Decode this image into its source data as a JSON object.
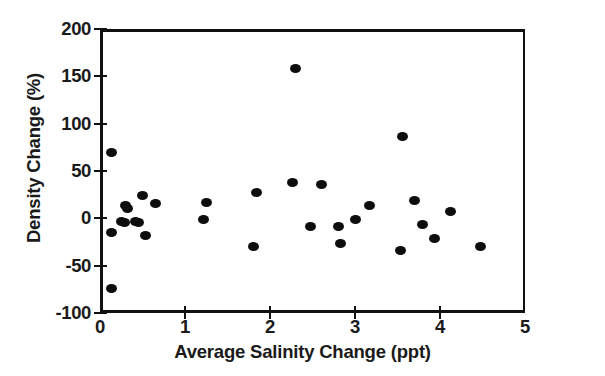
{
  "chart_data": {
    "type": "scatter",
    "title": "",
    "xlabel": "Average Salinity Change (ppt)",
    "ylabel": "Density Change (%)",
    "xlim": [
      0,
      5
    ],
    "ylim": [
      -100,
      200
    ],
    "xticks": [
      0,
      1,
      2,
      3,
      4,
      5
    ],
    "xtick_labels": [
      "0",
      "1",
      "2",
      "3",
      "4",
      "5"
    ],
    "yticks": [
      -100,
      -50,
      0,
      50,
      100,
      150,
      200
    ],
    "ytick_labels": [
      "-100",
      "-50",
      "0",
      "50",
      "100",
      "150",
      "200"
    ],
    "grid": false,
    "legend": null,
    "marker": "filled-circle",
    "marker_color": "#0d0d0d",
    "frame_color": "#111111",
    "points": [
      {
        "x": 0.13,
        "y": 70
      },
      {
        "x": 0.13,
        "y": -15
      },
      {
        "x": 0.14,
        "y": -74
      },
      {
        "x": 0.25,
        "y": -3
      },
      {
        "x": 0.29,
        "y": -4
      },
      {
        "x": 0.3,
        "y": 14
      },
      {
        "x": 0.32,
        "y": 10
      },
      {
        "x": 0.42,
        "y": -3
      },
      {
        "x": 0.45,
        "y": -4
      },
      {
        "x": 0.5,
        "y": 24
      },
      {
        "x": 0.53,
        "y": -18
      },
      {
        "x": 0.65,
        "y": 16
      },
      {
        "x": 1.22,
        "y": -1
      },
      {
        "x": 1.25,
        "y": 17
      },
      {
        "x": 1.8,
        "y": -30
      },
      {
        "x": 1.84,
        "y": 27
      },
      {
        "x": 2.27,
        "y": 38
      },
      {
        "x": 2.3,
        "y": 158
      },
      {
        "x": 2.48,
        "y": -9
      },
      {
        "x": 2.6,
        "y": 36
      },
      {
        "x": 2.8,
        "y": -9
      },
      {
        "x": 2.83,
        "y": -27
      },
      {
        "x": 3.0,
        "y": -1
      },
      {
        "x": 3.17,
        "y": 14
      },
      {
        "x": 3.53,
        "y": -34
      },
      {
        "x": 3.56,
        "y": 86
      },
      {
        "x": 3.7,
        "y": 19
      },
      {
        "x": 3.79,
        "y": -6
      },
      {
        "x": 3.93,
        "y": -21
      },
      {
        "x": 4.12,
        "y": 7
      },
      {
        "x": 4.48,
        "y": -30
      }
    ]
  }
}
